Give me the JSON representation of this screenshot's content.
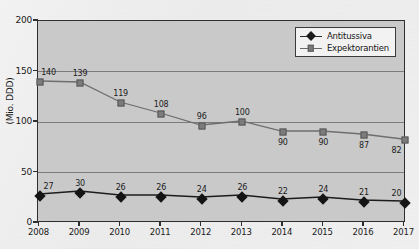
{
  "chart_data": {
    "type": "line",
    "title": "",
    "xlabel": "",
    "ylabel": "(Mio. DDD)",
    "categories": [
      "2008",
      "2009",
      "2010",
      "2011",
      "2012",
      "2013",
      "2014",
      "2015",
      "2016",
      "2017"
    ],
    "ylim": [
      0,
      200
    ],
    "yticks": [
      0,
      50,
      100,
      150,
      200
    ],
    "grid": true,
    "legend_position": "top-right",
    "series": [
      {
        "name": "Antitussiva",
        "marker": "diamond",
        "color": "#1c1c1c",
        "values": [
          27,
          30,
          26,
          26,
          24,
          26,
          22,
          24,
          21,
          20
        ],
        "label_positions": [
          "above",
          "above",
          "above",
          "above",
          "above",
          "above",
          "above",
          "above",
          "above",
          "above"
        ]
      },
      {
        "name": "Expektorantien",
        "marker": "square",
        "color": "#7a7a7a",
        "values": [
          140,
          139,
          119,
          108,
          96,
          100,
          90,
          90,
          87,
          82
        ],
        "label_positions": [
          "above",
          "above",
          "above",
          "above",
          "above",
          "above",
          "below",
          "below",
          "below",
          "below"
        ]
      }
    ]
  },
  "axes": {
    "y_tick_labels": [
      "0",
      "50",
      "100",
      "150",
      "200"
    ],
    "y_axis_title": "(Mio. DDD)",
    "x_tick_labels": [
      "2008",
      "2009",
      "2010",
      "2011",
      "2012",
      "2013",
      "2014",
      "2015",
      "2016",
      "2017"
    ]
  },
  "legend": {
    "items": [
      {
        "label": "Antitussiva",
        "marker": "diamond"
      },
      {
        "label": "Expektorantien",
        "marker": "square"
      }
    ]
  },
  "colors": {
    "plot_background": "#c9c9c9",
    "axis": "#2e2e2e",
    "grid": "#6e6e6e",
    "series_antitussiva": "#1c1c1c",
    "series_expektorantien": "#7a7a7a",
    "legend_background": "#f2f2f2"
  }
}
